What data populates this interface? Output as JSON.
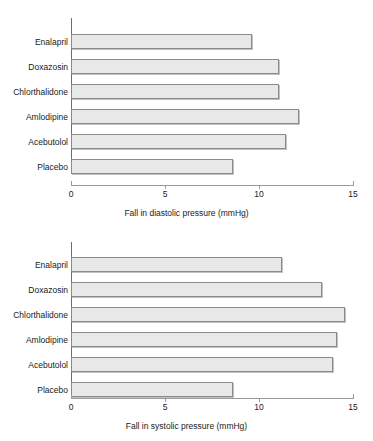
{
  "figure": {
    "panels": [
      "diastolic",
      "systolic"
    ]
  },
  "chart_data": [
    {
      "type": "bar",
      "orientation": "horizontal",
      "title": "",
      "xlabel": "Fall in diastolic pressure (mmHg)",
      "ylabel": "",
      "categories": [
        "Enalapril",
        "Doxazosin",
        "Chlorthalidone",
        "Amlodipine",
        "Acebutolol",
        "Placebo"
      ],
      "values": [
        9.6,
        11.0,
        11.0,
        12.1,
        11.4,
        8.6
      ],
      "xlim": [
        0,
        15
      ],
      "xticks": [
        0,
        5,
        10,
        15
      ],
      "xticklabels": [
        "0",
        "5",
        "10",
        "15"
      ],
      "grid": false,
      "legend": "none",
      "bar_fill": "#e8e8e8",
      "bar_edge": "#8a8a8a"
    },
    {
      "type": "bar",
      "orientation": "horizontal",
      "title": "",
      "xlabel": "Fall in systolic pressure (mmHg)",
      "ylabel": "",
      "categories": [
        "Enalapril",
        "Doxazosin",
        "Chlorthalidone",
        "Amlodipine",
        "Acebutolol",
        "Placebo"
      ],
      "values": [
        11.2,
        13.3,
        14.5,
        14.1,
        13.9,
        8.6
      ],
      "xlim": [
        0,
        15
      ],
      "xticks": [
        0,
        5,
        10,
        15
      ],
      "xticklabels": [
        "0",
        "5",
        "10",
        "15"
      ],
      "grid": false,
      "legend": "none",
      "bar_fill": "#e8e8e8",
      "bar_edge": "#8a8a8a"
    }
  ]
}
